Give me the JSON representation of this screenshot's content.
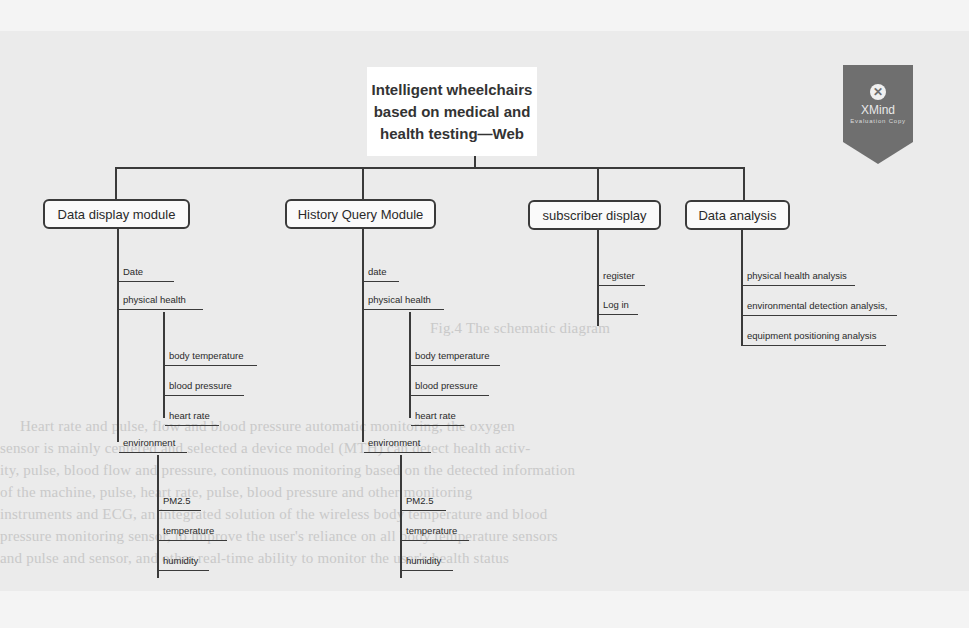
{
  "background_text": {
    "caption": "Fig.4  The schematic diagram",
    "lines": [
      "Heart rate and pulse, flow and blood pressure automatic monitoring, the oxygen",
      "sensor is mainly centered and selected a device model (MTH) can detect health activ-",
      "ity, pulse, blood flow and pressure, continuous monitoring based on the detected information",
      "of the machine, pulse, heart rate, pulse, blood pressure and other monitoring",
      "instruments and ECG, an integrated solution of the wireless body temperature and blood",
      "pressure monitoring sensor, to improve the user's reliance on all body temperature sensors",
      "and pulse and sensor, and other real-time ability to monitor the user's health status"
    ]
  },
  "root": {
    "title": "Intelligent wheelchairs based on medical and health testing—Web"
  },
  "watermark": {
    "icon": "xmind-close-icon",
    "glyph": "✕",
    "title": "XMind",
    "subtitle": "Evaluation Copy",
    "color": "#6f6f6f"
  },
  "modules": [
    {
      "label": "Data display module",
      "children": [
        {
          "label": "Date"
        },
        {
          "label": "physical health",
          "children": [
            "body temperature",
            "blood pressure",
            "heart rate"
          ]
        },
        {
          "label": "environment",
          "children": [
            "PM2.5",
            "temperature",
            "humidity"
          ]
        }
      ]
    },
    {
      "label": "History Query Module",
      "children": [
        {
          "label": "date"
        },
        {
          "label": "physical health",
          "children": [
            "body temperature",
            "blood pressure",
            "heart rate"
          ]
        },
        {
          "label": "environment",
          "children": [
            "PM2.5",
            "temperature",
            "humidity"
          ]
        }
      ]
    },
    {
      "label": "subscriber display",
      "children": [
        {
          "label": "register"
        },
        {
          "label": "Log in"
        }
      ]
    },
    {
      "label": "Data analysis",
      "children": [
        {
          "label": "physical health analysis"
        },
        {
          "label": "environmental detection analysis,"
        },
        {
          "label": "equipment positioning analysis"
        }
      ]
    }
  ]
}
